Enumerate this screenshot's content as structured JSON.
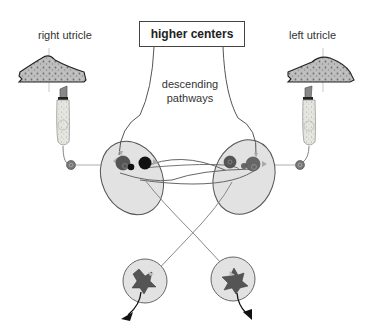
{
  "diagram": {
    "labels": {
      "right_utricle": "right utricle",
      "left_utricle": "left utricle",
      "higher_centers": "higher centers",
      "descending_line1": "descending",
      "descending_line2": "pathways"
    },
    "colors": {
      "line": "#555555",
      "nucleus_fill": "#e2e2e2",
      "nucleus_stroke": "#555555",
      "neuron_dark": "#4a4a4a",
      "neuron_black": "#111111",
      "tissue_fill": "#b8b8b8",
      "arrow": "#111111",
      "synapse_tri": "#aaaaaa"
    },
    "components": [
      "right utricle otolith membrane",
      "right hair cell",
      "right afferent ganglion cell",
      "left utricle otolith membrane",
      "left hair cell",
      "left afferent ganglion cell",
      "left vestibular nucleus (oval)",
      "right vestibular nucleus (oval)",
      "left motor neuron pool",
      "right motor neuron pool",
      "higher centers box",
      "descending pathways"
    ]
  }
}
